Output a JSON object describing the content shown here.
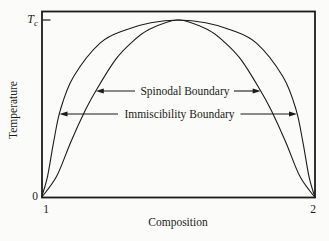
{
  "figure": {
    "y_axis_label": "Temperature",
    "x_axis_label": "Composition",
    "tc_main": "T",
    "tc_sub": "c",
    "y_origin_label": "0",
    "x_left_label": "1",
    "x_right_label": "2",
    "spinodal_label": "Spinodal Boundary",
    "immiscibility_label": "Immiscibility Boundary"
  },
  "colors": {
    "background": "#fbfbf9",
    "line": "#1b1b1b",
    "text": "#1b1b1b"
  },
  "chart_data": {
    "type": "line",
    "title": "",
    "xlabel": "Composition",
    "ylabel": "Temperature",
    "xlim": [
      1,
      2
    ],
    "ylim": [
      0,
      1
    ],
    "x_tick_labels": [
      "1",
      "2"
    ],
    "y_tick_labels": [
      "0",
      "Tc"
    ],
    "grid": false,
    "legend_position": "none",
    "annotations": [
      {
        "text": "Spinodal Boundary",
        "points_to": "Spinodal",
        "arrow_tips_T": 0.6
      },
      {
        "text": "Immiscibility Boundary",
        "points_to": "Immiscibility",
        "arrow_tips_T": 0.47
      }
    ],
    "series": [
      {
        "name": "Immiscibility Boundary",
        "points": [
          [
            1.0,
            0.0
          ],
          [
            1.022,
            0.118
          ],
          [
            1.044,
            0.309
          ],
          [
            1.069,
            0.494
          ],
          [
            1.117,
            0.68
          ],
          [
            1.215,
            0.871
          ],
          [
            1.307,
            0.944
          ],
          [
            1.4,
            0.985
          ],
          [
            1.5,
            1.0
          ],
          [
            1.6,
            0.985
          ],
          [
            1.693,
            0.944
          ],
          [
            1.785,
            0.871
          ],
          [
            1.883,
            0.68
          ],
          [
            1.931,
            0.494
          ],
          [
            1.956,
            0.309
          ],
          [
            1.978,
            0.118
          ],
          [
            2.0,
            0.0
          ]
        ]
      },
      {
        "name": "Spinodal Boundary",
        "points": [
          [
            1.0,
            0.0
          ],
          [
            1.055,
            0.118
          ],
          [
            1.106,
            0.309
          ],
          [
            1.161,
            0.494
          ],
          [
            1.201,
            0.607
          ],
          [
            1.27,
            0.775
          ],
          [
            1.328,
            0.871
          ],
          [
            1.39,
            0.944
          ],
          [
            1.5,
            1.0
          ],
          [
            1.61,
            0.944
          ],
          [
            1.672,
            0.871
          ],
          [
            1.73,
            0.775
          ],
          [
            1.799,
            0.607
          ],
          [
            1.839,
            0.494
          ],
          [
            1.894,
            0.309
          ],
          [
            1.945,
            0.118
          ],
          [
            2.0,
            0.0
          ]
        ]
      }
    ]
  }
}
